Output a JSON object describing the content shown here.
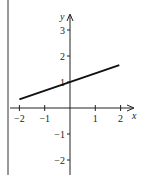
{
  "chart_data": {
    "type": "line",
    "title": "",
    "xlabel": "x",
    "ylabel": "y",
    "xlim": [
      -2.3,
      2.5
    ],
    "ylim": [
      -2.5,
      3.6
    ],
    "grid": false,
    "x_ticks": [
      -2,
      -1,
      1,
      2
    ],
    "y_ticks": [
      3,
      2,
      1,
      -1,
      -2
    ],
    "x_tick_labels": [
      "−2",
      "−1",
      "1",
      "2"
    ],
    "y_tick_labels": [
      "3",
      "2",
      "1",
      "−1",
      "−2"
    ],
    "series": [
      {
        "name": "line",
        "x": [
          -2,
          1.95
        ],
        "y": [
          0.33,
          1.65
        ],
        "color": "#111111"
      }
    ],
    "legend": null
  },
  "colors": {
    "axis": "#222222",
    "line": "#111111",
    "border": "#222222"
  }
}
